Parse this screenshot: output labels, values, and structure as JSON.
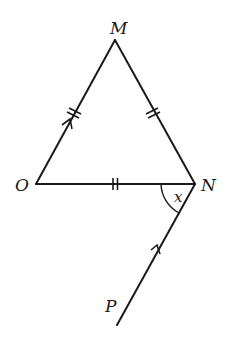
{
  "diagram": {
    "type": "geometry",
    "points": {
      "M": {
        "label": "M",
        "x": 115,
        "y": 40
      },
      "O": {
        "label": "O",
        "x": 36,
        "y": 184
      },
      "N": {
        "label": "N",
        "x": 195,
        "y": 184
      },
      "P": {
        "label": "P",
        "x": 117,
        "y": 325
      }
    },
    "segments": [
      {
        "from": "O",
        "to": "M",
        "equal_marks": 2,
        "parallel_arrow": 1
      },
      {
        "from": "M",
        "to": "N",
        "equal_marks": 2,
        "parallel_arrow": 0
      },
      {
        "from": "O",
        "to": "N",
        "equal_marks": 2,
        "parallel_arrow": 0
      },
      {
        "from": "P",
        "to": "N",
        "equal_marks": 0,
        "parallel_arrow": 1
      }
    ],
    "angles": [
      {
        "vertex": "N",
        "between": [
          "O",
          "P"
        ],
        "label": "x"
      }
    ],
    "labels": {
      "M": "M",
      "O": "O",
      "N": "N",
      "P": "P",
      "angle_x": "x"
    },
    "colors": {
      "stroke": "#1a1a1a",
      "background": "#ffffff"
    }
  }
}
